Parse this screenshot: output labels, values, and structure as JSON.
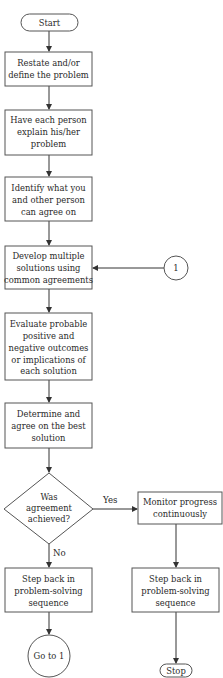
{
  "diagram": {
    "type": "flowchart",
    "nodes": {
      "start": {
        "label": "Start",
        "shape": "terminator"
      },
      "restate": {
        "lines": [
          "Restate and/or",
          "define the problem"
        ],
        "shape": "process"
      },
      "explain": {
        "lines": [
          "Have each person",
          "explain his/her",
          "problem"
        ],
        "shape": "process"
      },
      "identify": {
        "lines": [
          "Identify what you",
          "and other person",
          "can agree on"
        ],
        "shape": "process"
      },
      "develop": {
        "lines": [
          "Develop multiple",
          "solutions using",
          "common agreements"
        ],
        "shape": "process"
      },
      "connector_in": {
        "label": "1",
        "shape": "connector"
      },
      "evaluate": {
        "lines": [
          "Evaluate probable",
          "positive and",
          "negative outcomes",
          "or implications of",
          "each solution"
        ],
        "shape": "process"
      },
      "determine": {
        "lines": [
          "Determine and",
          "agree on the best",
          "solution"
        ],
        "shape": "process"
      },
      "decision": {
        "lines": [
          "Was",
          "agreement",
          "achieved?"
        ],
        "shape": "decision"
      },
      "monitor": {
        "lines": [
          "Monitor progress",
          "continuously"
        ],
        "shape": "process"
      },
      "step_back_no": {
        "lines": [
          "Step back in",
          "problem-solving",
          "sequence"
        ],
        "shape": "process"
      },
      "step_back_yes": {
        "lines": [
          "Step back in",
          "problem-solving",
          "sequence"
        ],
        "shape": "process"
      },
      "goto": {
        "label": "Go to 1",
        "shape": "connector"
      },
      "stop": {
        "label": "Stop",
        "shape": "terminator"
      }
    },
    "edges": {
      "yes_label": "Yes",
      "no_label": "No"
    }
  }
}
